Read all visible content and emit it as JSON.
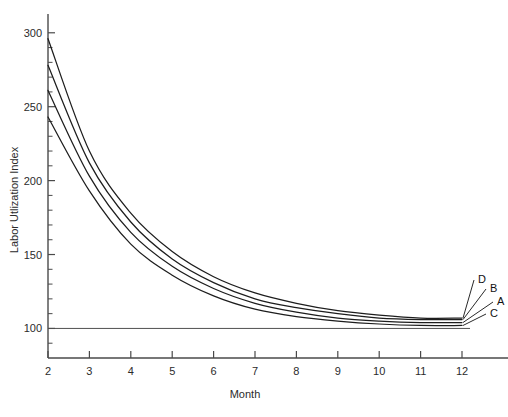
{
  "chart_data": {
    "type": "line",
    "title": "",
    "xlabel": "Month",
    "ylabel": "Labor Utlization Index",
    "xlim": [
      2,
      12
    ],
    "ylim": [
      80,
      310
    ],
    "grid": false,
    "legend_position": "right-endpoint-labels",
    "x": [
      2,
      3,
      4,
      5,
      6,
      7,
      8,
      9,
      10,
      11,
      12
    ],
    "x_tick_labels": [
      "2",
      "3",
      "4",
      "5",
      "6",
      "7",
      "8",
      "9",
      "10",
      "11",
      "12"
    ],
    "y_tick_labels": [
      "100",
      "150",
      "200",
      "250",
      "300"
    ],
    "y_ticks": [
      100,
      150,
      200,
      250,
      300
    ],
    "y_minor_ticks": [
      90,
      110,
      120,
      130,
      140,
      160,
      170,
      180,
      190,
      210,
      220,
      230,
      240,
      260,
      270,
      280,
      290
    ],
    "reference_line": {
      "label": "100",
      "value": 100
    },
    "series": [
      {
        "name": "D",
        "values": [
          296,
          220,
          178,
          152,
          135,
          124,
          117,
          112,
          109,
          107,
          107
        ]
      },
      {
        "name": "B",
        "values": [
          278,
          212,
          172,
          147,
          131,
          120,
          114,
          110,
          107,
          106,
          106
        ]
      },
      {
        "name": "A",
        "values": [
          261,
          203,
          165,
          142,
          127,
          117,
          111,
          107,
          105,
          104,
          104
        ]
      },
      {
        "name": "C",
        "values": [
          243,
          193,
          157,
          136,
          122,
          113,
          108,
          105,
          103,
          102,
          102
        ]
      }
    ],
    "endpoint_labels": [
      "D",
      "B",
      "A",
      "C"
    ],
    "annotations": []
  },
  "axis": {
    "x_title": "Month",
    "y_title": "Labor Utlization Index"
  }
}
